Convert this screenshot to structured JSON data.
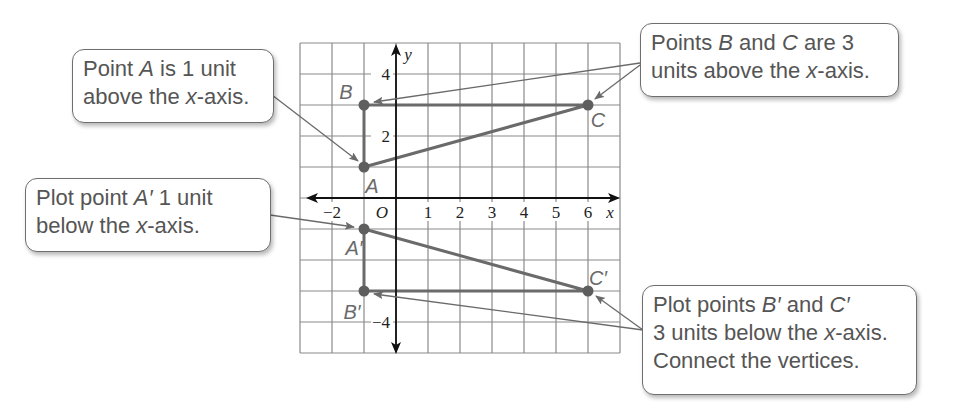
{
  "graph": {
    "x_axis_label": "x",
    "y_axis_label": "y",
    "origin_label": "O",
    "x_tick_labels": [
      {
        "value": -2,
        "label": "−2"
      },
      {
        "value": 1,
        "label": "1"
      },
      {
        "value": 2,
        "label": "2"
      },
      {
        "value": 3,
        "label": "3"
      },
      {
        "value": 4,
        "label": "4"
      },
      {
        "value": 5,
        "label": "5"
      },
      {
        "value": 6,
        "label": "6"
      }
    ],
    "y_tick_labels": [
      {
        "value": 4,
        "label": "4"
      },
      {
        "value": 2,
        "label": "2"
      },
      {
        "value": -4,
        "label": "−4"
      }
    ],
    "x_range": [
      -3,
      7
    ],
    "y_range": [
      -5,
      5
    ],
    "grid": true,
    "colors": {
      "grid": "#8a8a8a",
      "axes": "#111111",
      "shape": "#6a6a6a",
      "point": "#5e5e5e",
      "label": "#6a6a6a",
      "arrow": "#6a6a6a"
    },
    "points": [
      {
        "name": "A",
        "label": "A",
        "x": -1,
        "y": 1
      },
      {
        "name": "B",
        "label": "B",
        "x": -1,
        "y": 3
      },
      {
        "name": "C",
        "label": "C",
        "x": 6,
        "y": 3
      },
      {
        "name": "A-prime",
        "label": "A′",
        "x": -1,
        "y": -1
      },
      {
        "name": "B-prime",
        "label": "B′",
        "x": -1,
        "y": -3
      },
      {
        "name": "C-prime",
        "label": "C′",
        "x": 6,
        "y": -3
      }
    ],
    "triangles": [
      {
        "name": "triangle-abc",
        "vertices": [
          "A",
          "B",
          "C"
        ]
      },
      {
        "name": "triangle-a-prime-b-prime-c-prime",
        "vertices": [
          "A′",
          "B′",
          "C′"
        ]
      }
    ]
  },
  "callouts": {
    "point_a": {
      "line1_pre": "Point ",
      "line1_var": "A",
      "line1_post": " is 1 unit",
      "line2_pre": "above the ",
      "line2_var": "x",
      "line2_post": "-axis."
    },
    "plot_a_prime": {
      "line1_pre": "Plot point ",
      "line1_var": "A′",
      "line1_post": " 1 unit",
      "line2_pre": "below the ",
      "line2_var": "x",
      "line2_post": "-axis."
    },
    "points_b_c": {
      "line1_pre": "Points ",
      "line1_var1": "B",
      "line1_mid": " and ",
      "line1_var2": "C",
      "line1_post": " are 3",
      "line2_pre": "units above the ",
      "line2_var": "x",
      "line2_post": "-axis."
    },
    "plot_b_c_prime": {
      "line1_pre": "Plot points ",
      "line1_var1": "B′",
      "line1_mid": " and ",
      "line1_var2": "C′",
      "line2_pre": "3 units below the ",
      "line2_var": "x",
      "line2_post": "-axis.",
      "line3": "Connect the vertices."
    }
  }
}
